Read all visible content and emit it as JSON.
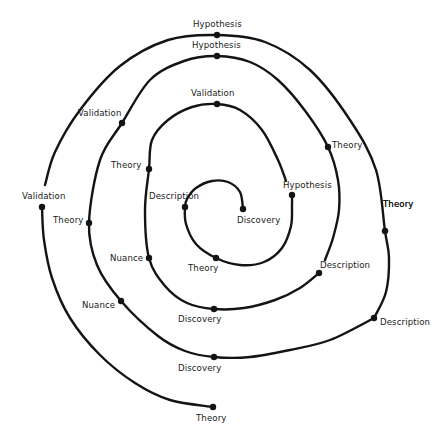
{
  "diagram": {
    "title": "",
    "nodes": [
      {
        "id": "n1",
        "label": "Discovery"
      },
      {
        "id": "n2",
        "label": "Description"
      },
      {
        "id": "n3",
        "label": "Theory"
      },
      {
        "id": "n4",
        "label": "Hypothesis"
      },
      {
        "id": "n5",
        "label": "Theory"
      },
      {
        "id": "n6",
        "label": "Validation"
      },
      {
        "id": "n7",
        "label": "Theory"
      },
      {
        "id": "n8",
        "label": "Nuance"
      },
      {
        "id": "n9",
        "label": "Discovery"
      },
      {
        "id": "n10",
        "label": "Description"
      },
      {
        "id": "n11",
        "label": "Theory"
      },
      {
        "id": "n12",
        "label": "Hypothesis"
      },
      {
        "id": "n13",
        "label": "Validation"
      },
      {
        "id": "n14",
        "label": "Theory"
      },
      {
        "id": "n15",
        "label": "Nuance"
      },
      {
        "id": "n16",
        "label": "Discovery"
      },
      {
        "id": "n17",
        "label": "Description"
      },
      {
        "id": "n18",
        "label": "Theory"
      },
      {
        "id": "n19",
        "label": "Hypothesis"
      },
      {
        "id": "n20",
        "label": "Validation"
      },
      {
        "id": "n21",
        "label": "Theory"
      }
    ],
    "sequence": [
      "n1",
      "n2",
      "n3",
      "n4",
      "n5",
      "n6",
      "n7",
      "n8",
      "n9",
      "n10",
      "n11",
      "n12",
      "n13",
      "n14",
      "n15",
      "n16",
      "n17",
      "n18",
      "n19",
      "n20",
      "n21"
    ],
    "segment_breaks_before": [
      "n4",
      "n10",
      "n20"
    ]
  }
}
